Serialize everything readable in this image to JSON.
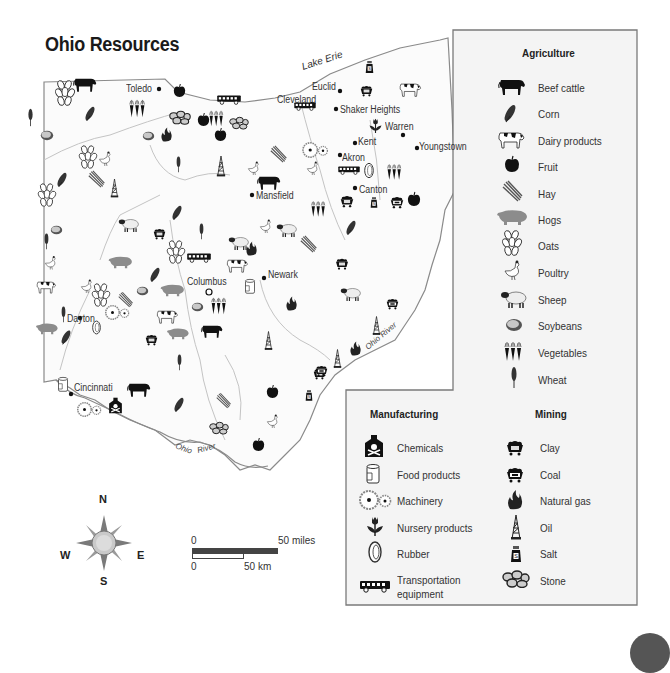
{
  "title": "Ohio Resources",
  "map": {
    "water_labels": {
      "lake_erie": "Lake Erie",
      "ohio_river_south": [
        "Ohio",
        "River"
      ],
      "ohio_river_east": "Ohio River"
    },
    "cities": [
      {
        "name": "Toledo",
        "x": 125,
        "y": 84
      },
      {
        "name": "Cleveland",
        "x": 277,
        "y": 95
      },
      {
        "name": "Euclid",
        "x": 312,
        "y": 82
      },
      {
        "name": "Shaker Heights",
        "x": 340,
        "y": 108
      },
      {
        "name": "Warren",
        "x": 385,
        "y": 123
      },
      {
        "name": "Youngstown",
        "x": 419,
        "y": 143
      },
      {
        "name": "Kent",
        "x": 358,
        "y": 139
      },
      {
        "name": "Akron",
        "x": 342,
        "y": 155
      },
      {
        "name": "Canton",
        "x": 358,
        "y": 187
      },
      {
        "name": "Mansfield",
        "x": 256,
        "y": 191
      },
      {
        "name": "Columbus",
        "x": 187,
        "y": 278
      },
      {
        "name": "Newark",
        "x": 266,
        "y": 271
      },
      {
        "name": "Dayton",
        "x": 67,
        "y": 314
      },
      {
        "name": "Cincinnati",
        "x": 74,
        "y": 386
      }
    ]
  },
  "legend": {
    "agriculture": {
      "heading": "Agriculture",
      "items": [
        {
          "label": "Beef cattle",
          "icon": "beef-cattle-icon"
        },
        {
          "label": "Corn",
          "icon": "corn-icon"
        },
        {
          "label": "Dairy products",
          "icon": "dairy-cow-icon"
        },
        {
          "label": "Fruit",
          "icon": "apple-icon"
        },
        {
          "label": "Hay",
          "icon": "hay-icon"
        },
        {
          "label": "Hogs",
          "icon": "hog-icon"
        },
        {
          "label": "Oats",
          "icon": "oats-icon"
        },
        {
          "label": "Poultry",
          "icon": "chicken-icon"
        },
        {
          "label": "Sheep",
          "icon": "sheep-icon"
        },
        {
          "label": "Soybeans",
          "icon": "soybean-icon"
        },
        {
          "label": "Vegetables",
          "icon": "carrots-icon"
        },
        {
          "label": "Wheat",
          "icon": "wheat-icon"
        }
      ]
    },
    "manufacturing": {
      "heading": "Manufacturing",
      "items": [
        {
          "label": "Chemicals",
          "icon": "chemical-bottle-icon"
        },
        {
          "label": "Food products",
          "icon": "can-icon"
        },
        {
          "label": "Machinery",
          "icon": "gears-icon"
        },
        {
          "label": "Nursery products",
          "icon": "tulip-icon"
        },
        {
          "label": "Rubber",
          "icon": "tire-icon"
        },
        {
          "label": "Transportation",
          "label2": "equipment",
          "icon": "bus-icon"
        }
      ]
    },
    "mining": {
      "heading": "Mining",
      "items": [
        {
          "label": "Clay",
          "icon": "clay-cart-icon"
        },
        {
          "label": "Coal",
          "icon": "coal-cart-icon"
        },
        {
          "label": "Natural gas",
          "icon": "flame-icon"
        },
        {
          "label": "Oil",
          "icon": "oil-derrick-icon"
        },
        {
          "label": "Salt",
          "icon": "salt-shaker-icon"
        },
        {
          "label": "Stone",
          "icon": "stones-icon"
        }
      ]
    }
  },
  "compass": {
    "n": "N",
    "s": "S",
    "e": "E",
    "w": "W"
  },
  "scale": {
    "miles_start": "0",
    "miles_end": "50 miles",
    "km_start": "0",
    "km_end": "50 km"
  },
  "colors": {
    "state_border": "#888888",
    "county_lines": "#bbbbbb",
    "legend_bg": "#f4f4f4",
    "legend_border": "#7a7a7a",
    "compass_fill": "#8a8a8a",
    "hog_color": "#8c8c8c"
  }
}
